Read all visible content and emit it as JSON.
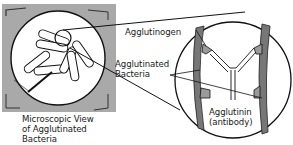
{
  "diagram": {
    "labels": {
      "agglutinogen": "Agglutinogen",
      "agglutinated_bacteria_line1": "Agglutinated",
      "agglutinated_bacteria_line2": "Bacteria",
      "agglutinin_line1": "Agglutinin",
      "agglutinin_line2": "(antibody)",
      "micro_view_line1": "Microscopic View",
      "micro_view_line2": "of Agglutinated",
      "micro_view_line3": "Bacteria"
    },
    "colors": {
      "square_bg": "#a8a8a8",
      "line": "#111111",
      "circle_fill": "#ffffff",
      "agglutinogen": "#9a9a9a"
    }
  }
}
